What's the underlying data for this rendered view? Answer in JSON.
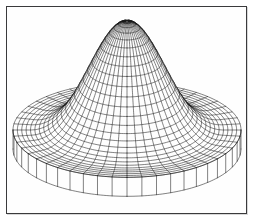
{
  "figure": {
    "title": "Sombrero surface wireframe",
    "kind": "3d-surface-wireframe",
    "background_color": "#ffffff",
    "mesh_color": "#1a1a1a",
    "frame_color": "#3a3a3c",
    "frame": {
      "x": 6,
      "y": 6,
      "width": 241,
      "height": 208
    }
  },
  "chart_data": {
    "type": "line",
    "title": "",
    "subtitle": "",
    "xlabel": "",
    "ylabel": "",
    "zlabel": "",
    "surface_function": "sombrero",
    "formula": "z(r) = A * exp(-(r/s)^2) + B, radially symmetric Mexican-hat / sombrero profile with flat raised annular brim",
    "grid": true,
    "legend": false,
    "legend_position": "none",
    "axes_visible": false,
    "tick_labels": [],
    "annotations": [],
    "projection": {
      "type": "orthographic",
      "elevation_deg": 26,
      "azimuth_deg": 0,
      "center_x": 127,
      "center_y": 130,
      "scale_x": 1.0,
      "scale_y": 0.415,
      "height_scale": 1.0
    },
    "domain": {
      "r_min": 0.0,
      "r_max": 1.0,
      "theta_min": 0,
      "theta_max": 6.283185307179586
    },
    "mesh": {
      "radial_divisions": 26,
      "angular_divisions": 48,
      "line_width": 0.55
    },
    "radial_profile": {
      "r": [
        0.0,
        0.04,
        0.08,
        0.12,
        0.16,
        0.2,
        0.24,
        0.28,
        0.32,
        0.36,
        0.4,
        0.44,
        0.48,
        0.52,
        0.56,
        0.6,
        0.64,
        0.68,
        0.72,
        0.76,
        0.8,
        0.84,
        0.88,
        0.92,
        0.96,
        1.0
      ],
      "z": [
        1.0,
        0.993,
        0.972,
        0.938,
        0.892,
        0.835,
        0.77,
        0.699,
        0.624,
        0.548,
        0.473,
        0.401,
        0.334,
        0.273,
        0.22,
        0.175,
        0.138,
        0.109,
        0.087,
        0.072,
        0.063,
        0.06,
        0.06,
        0.06,
        0.06,
        0.06
      ],
      "z_min": 0.0,
      "z_max": 1.0
    },
    "features": [
      {
        "name": "central-peak",
        "r": 0.0,
        "z": 1.0,
        "screen_x": 127,
        "screen_y": 14
      },
      {
        "name": "trough-ring",
        "r": 0.8,
        "z": 0.063
      },
      {
        "name": "brim-outer-rim",
        "r": 1.0,
        "z": 0.06
      },
      {
        "name": "brim-front-bottom",
        "screen_y": 195
      },
      {
        "name": "brim-left-extent",
        "screen_x": 12
      },
      {
        "name": "brim-right-extent",
        "screen_x": 241
      }
    ],
    "brim": {
      "outer_radius": 1.0,
      "inner_visible_radius": 0.78,
      "wall_depth_px": 19,
      "top_ellipse": {
        "cx": 127,
        "cy": 128,
        "rx": 114,
        "ry": 47
      }
    }
  }
}
